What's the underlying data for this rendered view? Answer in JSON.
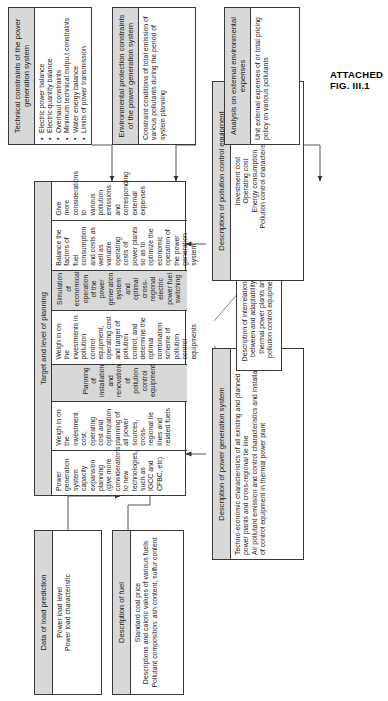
{
  "figure": {
    "caption": "ATTACHED FIG. III.1"
  },
  "inputs": {
    "load": {
      "title": "Data of load prediction",
      "items": "Power load level\nPower load characteristic"
    },
    "fuel": {
      "title": "Description of fuel",
      "items": "Standard coal price\nDescriptions and caloric values of various fuels\nPollutant composition: ash content, sulfur content"
    },
    "power_system": {
      "title": "Description of power generation system",
      "items": "Techno-economic characteristics of all existing and planned power plants and cross-regional tie line\nAir pollutant emission and control characteristics and installation of control equipment in thermal power plant"
    },
    "interrelationship": {
      "text": "Description of interrelationship between and adaptability of thermal power plants and pollution control equipments"
    },
    "pollution_equipment": {
      "title": "Description of pollution control equipment",
      "items": "Investment cost\nOperating cost\nEnergy consumption\nPollution control characteristics"
    }
  },
  "target": {
    "title": "Target and level of planning",
    "rows": [
      {
        "shaded": false,
        "text": "Power generation system capacity expansion planning (give more considerations to new technologies, such as IGCC and CFBC, etc)"
      },
      {
        "shaded": false,
        "text": "Weigh in on the investment cost, operating cost and optimization planning of all power sources, cross-regional tie lines and related fuels"
      },
      {
        "shaded": true,
        "text": "Planning of installation and renovation of pollution control equipment"
      },
      {
        "shaded": false,
        "text": "Weigh in on the investments in pollution control equipment, operating cost and target of pollution control, and determine the optimal combination scheme of pollution control equipments"
      },
      {
        "shaded": true,
        "text": "Simulation of economical operation of the power generation system and optimal cross-regional electric power fuel switching"
      },
      {
        "shaded": false,
        "text": "Balance the factors of fuel consumption and costs as well as variable operating costs of power plants so as to optimize the economic operation of the power generation system"
      },
      {
        "shaded": false,
        "text": "Give more considerations to various pollution emissions and corresponding external expenses"
      }
    ]
  },
  "constraints": {
    "technical": {
      "title": "Technical constraints of the power generation system",
      "bullets": [
        "Electric power balance",
        "Electric quantity balance",
        "Overhaul constraints",
        "Minimum technical outpu.t constraints",
        "Water energy balance",
        "Limits of power transmission"
      ]
    },
    "environmental": {
      "title": "Environmental protection constraints of the power generation system",
      "text": "Constraint conditions of total emission of various pollutants during the period of system planning"
    },
    "external": {
      "title": "Analysis on external environmental expenses",
      "text": "Unit external expenses of or total pricing policy on various pollutants"
    }
  }
}
